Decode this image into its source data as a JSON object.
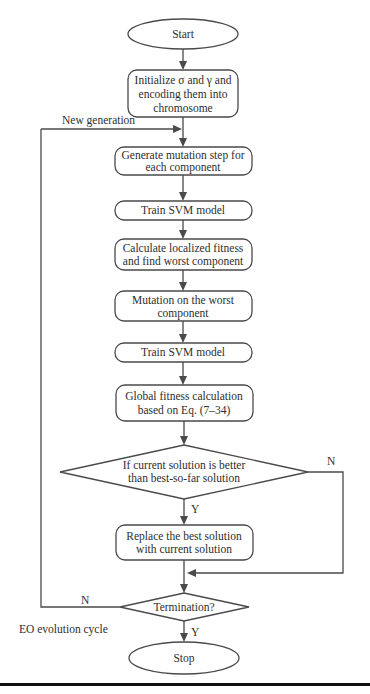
{
  "flowchart": {
    "start": "Start",
    "init": [
      "Initialize σ and γ and",
      "encoding them into",
      "chromosome"
    ],
    "new_generation_label": "New generation",
    "generate": [
      "Generate mutation step for",
      "each component"
    ],
    "train1": "Train SVM model",
    "calculate": [
      "Calculate localized fitness",
      "and find worst component"
    ],
    "mutation": [
      "Mutation on the worst",
      "component"
    ],
    "train2": "Train SVM model",
    "global": [
      "Global fitness calculation",
      "based on Eq. (7–34)"
    ],
    "decision": [
      "If current solution is better",
      "than best-so-far solution"
    ],
    "decision_yes": "Y",
    "decision_no": "N",
    "replace": [
      "Replace the best solution",
      "with current solution"
    ],
    "termination": "Termination?",
    "termination_yes": "Y",
    "termination_no": "N",
    "cycle_label": "EO evolution cycle",
    "stop": "Stop"
  }
}
